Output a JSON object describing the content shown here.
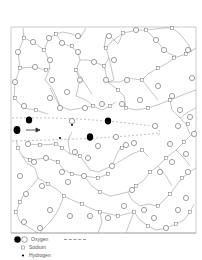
{
  "figure": {
    "type": "glass network structure diagram",
    "frame": {
      "x": 11,
      "y": 27,
      "width": 185,
      "height": 206
    },
    "colors": {
      "line": "#8a8a8a",
      "oxygen_fill": "#ffffff",
      "oxygen_highlight": "#000000",
      "frame": "#999999",
      "path": "#999999"
    }
  },
  "legend": {
    "items": [
      {
        "symbol": "oxygen-filled-and-open-circle",
        "label": "Oxygen"
      },
      {
        "symbol": "sodium-small-square",
        "label": "Sodium"
      },
      {
        "symbol": "hydrogen-small-dot",
        "label": "Hydrogen"
      }
    ],
    "dashed_line": "diffusion path"
  },
  "annotations": {
    "arrow": "right",
    "highlighted_oxygen_count": 5
  }
}
